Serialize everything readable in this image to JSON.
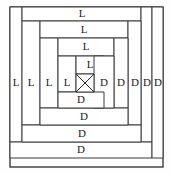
{
  "figure": {
    "center_symbol": "X",
    "light_label": "L",
    "dark_label": "D",
    "colors": {
      "line": "#3a3a3a",
      "frame": "#2b2b2b",
      "fill": "#ffffff",
      "text": "#1a1a1a",
      "background": "#fefefe"
    }
  },
  "chart_data": {
    "type": "diagram",
    "center": {
      "label": "X",
      "x": 76,
      "y": 74,
      "width": 18,
      "height": 18
    },
    "rounds": [
      {
        "index": 1,
        "top": {
          "label": "L",
          "x": 76,
          "y": 56,
          "width": 28,
          "height": 18,
          "cx": 90,
          "cy": 65
        },
        "left": {
          "label": "L",
          "x": 58,
          "y": 56,
          "width": 18,
          "height": 36,
          "cx": 67,
          "cy": 83
        },
        "bottom": {
          "label": "D",
          "x": 58,
          "y": 92,
          "width": 46,
          "height": 16,
          "cx": 81,
          "cy": 100
        },
        "right": {
          "label": "D",
          "x": 94,
          "y": 56,
          "width": 20,
          "height": 52,
          "cx": 104,
          "cy": 83
        }
      },
      {
        "index": 2,
        "top": {
          "label": "L",
          "x": 58,
          "y": 38,
          "width": 56,
          "height": 18,
          "cx": 86,
          "cy": 47
        },
        "left": {
          "label": "L",
          "x": 40,
          "y": 38,
          "width": 18,
          "height": 70,
          "cx": 49,
          "cy": 83
        },
        "bottom": {
          "label": "D",
          "x": 40,
          "y": 108,
          "width": 88,
          "height": 17,
          "cx": 84,
          "cy": 117
        },
        "right": {
          "label": "D",
          "x": 114,
          "y": 38,
          "width": 14,
          "height": 70,
          "cx": 121,
          "cy": 83
        }
      },
      {
        "index": 3,
        "top": {
          "label": "L",
          "x": 40,
          "y": 21,
          "width": 88,
          "height": 17,
          "cx": 84,
          "cy": 30
        },
        "left": {
          "label": "L",
          "x": 22,
          "y": 21,
          "width": 18,
          "height": 104,
          "cx": 31,
          "cy": 83
        },
        "bottom": {
          "label": "D",
          "x": 22,
          "y": 125,
          "width": 119,
          "height": 17,
          "cx": 82,
          "cy": 134
        },
        "right": {
          "label": "D",
          "x": 128,
          "y": 21,
          "width": 13,
          "height": 104,
          "cx": 135,
          "cy": 83
        }
      },
      {
        "index": 4,
        "top": {
          "label": "L",
          "x": 22,
          "y": 7,
          "width": 119,
          "height": 14,
          "cx": 82,
          "cy": 14
        },
        "left": {
          "label": "L",
          "x": 10,
          "y": 7,
          "width": 12,
          "height": 135,
          "cx": 16,
          "cy": 83
        },
        "bottom": {
          "label": "D",
          "x": 10,
          "y": 142,
          "width": 142,
          "height": 16,
          "cx": 81,
          "cy": 150
        },
        "right": {
          "label": "D",
          "x": 141,
          "y": 7,
          "width": 11,
          "height": 135,
          "cx": 147,
          "cy": 83
        }
      }
    ],
    "outer_frame": {
      "x": 10,
      "y": 7,
      "width": 153,
      "height": 160
    },
    "extra_right_log": {
      "label": "D",
      "x": 152,
      "y": 7,
      "width": 11,
      "height": 151,
      "cx": 158,
      "cy": 83
    },
    "light_count": 8,
    "dark_count": 8,
    "row_labels_top_to_bottom": [
      "L",
      "L",
      "L",
      "L",
      "X",
      "D",
      "D",
      "D",
      "D"
    ],
    "col_labels_left_to_right": [
      "L",
      "L",
      "L",
      "L",
      "X",
      "D",
      "D",
      "D",
      "D"
    ]
  }
}
